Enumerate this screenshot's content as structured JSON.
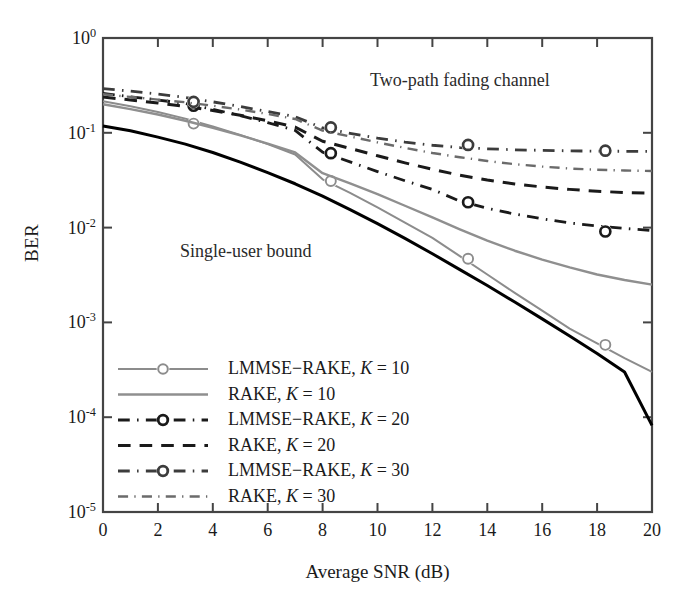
{
  "chart_data": {
    "type": "line",
    "title": "",
    "xlabel": "Average SNR (dB)",
    "ylabel": "BER",
    "xlim": [
      0,
      20
    ],
    "ylim": [
      1e-05,
      1
    ],
    "yscale": "log",
    "grid": false,
    "legend_position": "lower left",
    "xticks": [
      "0",
      "2",
      "4",
      "6",
      "8",
      "10",
      "12",
      "14",
      "16",
      "18",
      "20"
    ],
    "xtick_values": [
      0,
      2,
      4,
      6,
      8,
      10,
      12,
      14,
      16,
      18,
      20
    ],
    "ytick_labels": [
      "10<sup>0</sup>",
      "10<sup>-1</sup>",
      "10<sup>-2</sup>",
      "10<sup>-3</sup>",
      "10<sup>-4</sup>",
      "10<sup>-5</sup>"
    ],
    "ytick_values": [
      1,
      0.1,
      0.01,
      0.001,
      0.0001,
      1e-05
    ],
    "annotations": [
      {
        "text": "Two-path fading channel",
        "x": 13.0,
        "y": 0.35
      },
      {
        "text": "Single-user bound",
        "x": 5.2,
        "y": 0.0055
      }
    ],
    "x": [
      0,
      1,
      2,
      3,
      4,
      5,
      6,
      7,
      8,
      9,
      10,
      11,
      12,
      13,
      14,
      15,
      16,
      17,
      18,
      19,
      20
    ],
    "marker_x": [
      3.3,
      8.3,
      13.3,
      18.3
    ],
    "series": [
      {
        "name": "Single-user bound",
        "color": "#000000",
        "style": "solid",
        "width": 3.0,
        "marker": "none",
        "values": [
          0.118,
          0.105,
          0.09,
          0.076,
          0.062,
          0.049,
          0.038,
          0.029,
          0.0215,
          0.0155,
          0.011,
          0.0077,
          0.0053,
          0.0036,
          0.00245,
          0.00164,
          0.00109,
          0.00072,
          0.00047,
          0.0003,
          8.2e-05
        ]
      },
      {
        "name": "LMMSE-RAKE, K = 10",
        "color": "#8c8c8c",
        "style": "solid",
        "width": 2.0,
        "marker": "circle",
        "marker_values": [
          0.125,
          0.031,
          0.0047,
          0.00058
        ],
        "values": [
          0.215,
          0.191,
          0.166,
          0.141,
          0.117,
          0.095,
          0.076,
          0.059,
          0.0323,
          0.0232,
          0.0163,
          0.0113,
          0.0078,
          0.005,
          0.0032,
          0.00205,
          0.00133,
          0.00086,
          0.0006,
          0.00042,
          0.0003
        ]
      },
      {
        "name": "RAKE, K = 10",
        "color": "#8f8f8f",
        "style": "solid",
        "width": 2.4,
        "marker": "none",
        "values": [
          0.2,
          0.178,
          0.156,
          0.134,
          0.113,
          0.094,
          0.077,
          0.062,
          0.0375,
          0.0292,
          0.0225,
          0.017,
          0.0128,
          0.0096,
          0.0073,
          0.0057,
          0.0046,
          0.0038,
          0.0032,
          0.0028,
          0.0025
        ]
      },
      {
        "name": "LMMSE-RAKE, K = 20",
        "color": "#1a1a1a",
        "style": "dashdot",
        "width": 2.8,
        "marker": "circle",
        "marker_values": [
          0.193,
          0.061,
          0.0185,
          0.0091
        ],
        "values": [
          0.26,
          0.24,
          0.222,
          0.204,
          0.177,
          0.152,
          0.128,
          0.106,
          0.0625,
          0.0493,
          0.039,
          0.0312,
          0.0253,
          0.019,
          0.016,
          0.0139,
          0.0124,
          0.0112,
          0.0104,
          0.0098,
          0.0093
        ]
      },
      {
        "name": "RAKE, K = 20",
        "color": "#1a1a1a",
        "style": "dashed",
        "width": 3.0,
        "marker": "none",
        "values": [
          0.238,
          0.222,
          0.206,
          0.19,
          0.172,
          0.153,
          0.134,
          0.115,
          0.0815,
          0.0684,
          0.0572,
          0.0482,
          0.0412,
          0.0357,
          0.0318,
          0.0289,
          0.0268,
          0.0253,
          0.0242,
          0.0234,
          0.0231
        ]
      },
      {
        "name": "LMMSE-RAKE, K = 30",
        "color": "#3c3c3c",
        "style": "dashdot",
        "width": 2.8,
        "marker": "circle",
        "marker_values": [
          0.212,
          0.114,
          0.0745,
          0.0648
        ],
        "values": [
          0.293,
          0.275,
          0.256,
          0.236,
          0.212,
          0.189,
          0.168,
          0.148,
          0.1125,
          0.0988,
          0.0879,
          0.0797,
          0.0739,
          0.0699,
          0.0678,
          0.0662,
          0.0652,
          0.0645,
          0.064,
          0.0638,
          0.0636
        ]
      },
      {
        "name": "RAKE, K = 30",
        "color": "#6b6b6b",
        "style": "dashdot",
        "width": 2.4,
        "marker": "none",
        "values": [
          0.255,
          0.239,
          0.224,
          0.21,
          0.193,
          0.176,
          0.158,
          0.14,
          0.1055,
          0.0915,
          0.0792,
          0.0693,
          0.0613,
          0.0552,
          0.0504,
          0.0467,
          0.044,
          0.042,
          0.0408,
          0.04,
          0.0396
        ]
      }
    ]
  },
  "legend": {
    "items": [
      {
        "label_pre": "LMMSE−RAKE, ",
        "label_k": "K",
        "label_post": " = 10",
        "series_index": 1
      },
      {
        "label_pre": "RAKE, ",
        "label_k": "K",
        "label_post": " = 10",
        "series_index": 2
      },
      {
        "label_pre": "LMMSE−RAKE, ",
        "label_k": "K",
        "label_post": " = 20",
        "series_index": 3
      },
      {
        "label_pre": "RAKE, ",
        "label_k": "K",
        "label_post": " = 20",
        "series_index": 4
      },
      {
        "label_pre": "LMMSE−RAKE, ",
        "label_k": "K",
        "label_post": " = 30",
        "series_index": 5
      },
      {
        "label_pre": "RAKE, ",
        "label_k": "K",
        "label_post": " = 30",
        "series_index": 6
      }
    ]
  },
  "axes": {
    "x_title": "Average SNR (dB)",
    "y_title": "BER"
  },
  "annotations": {
    "channel_note": "Two-path fading channel",
    "bound_note": "Single-user bound"
  },
  "colors": {
    "frame": "#444444",
    "bound": "#000000",
    "gray_light": "#8f8f8f",
    "gray_mid": "#6b6b6b",
    "gray_dark": "#3c3c3c",
    "black": "#1a1a1a"
  }
}
